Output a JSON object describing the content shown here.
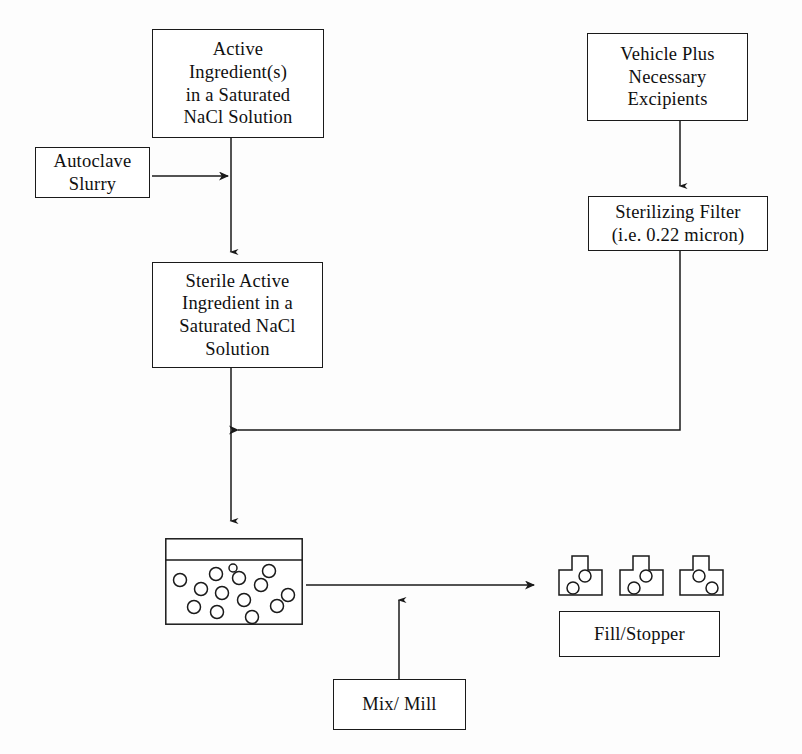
{
  "diagram": {
    "background_color": "#fdfdfd",
    "line_color": "#1a1a1a",
    "nodes": {
      "active_ingredient": "Active\nIngredient(s)\nin a Saturated\nNaCl Solution",
      "vehicle_plus": "Vehicle Plus\nNecessary\nExcipients",
      "autoclave": "Autoclave\nSlurry",
      "sterilizing_filter": "Sterilizing Filter\n(i.e. 0.22 micron)",
      "sterile_active": "Sterile Active\nIngredient in a\nSaturated NaCl\nSolution",
      "fill_stopper": "Fill/Stopper",
      "mix_mill": "Mix/ Mill"
    },
    "shapes": {
      "vessel": {
        "name": "suspension-vessel",
        "particle_count": 14,
        "has_liquid_level_line": true
      },
      "vials": {
        "name": "stoppered-vials",
        "count": 3,
        "circles_per_vial": 2
      }
    },
    "connectors": [
      {
        "name": "active-ingredient-to-sterile-active",
        "from": "active_ingredient",
        "to": "sterile_active",
        "direction": "down",
        "arrowhead": true
      },
      {
        "name": "autoclave-to-main-line",
        "from": "autoclave",
        "to": "active-ingredient-downline",
        "direction": "right",
        "arrowhead": true
      },
      {
        "name": "vehicle-to-sterilizing-filter",
        "from": "vehicle_plus",
        "to": "sterilizing_filter",
        "direction": "down",
        "arrowhead": true
      },
      {
        "name": "sterilizing-filter-to-main-line",
        "from": "sterilizing_filter",
        "to": "sterile-active-downline",
        "direction": "down-then-left",
        "arrowhead": true
      },
      {
        "name": "sterile-active-to-vessel",
        "from": "sterile_active",
        "to": "vessel",
        "direction": "down",
        "arrowhead": true
      },
      {
        "name": "vessel-to-vials",
        "from": "vessel",
        "to": "vials",
        "direction": "right",
        "arrowhead": true
      },
      {
        "name": "mix-mill-to-vessel-line",
        "from": "mix_mill",
        "to": "vessel-to-vials-line",
        "direction": "up",
        "arrowhead": true
      }
    ]
  }
}
